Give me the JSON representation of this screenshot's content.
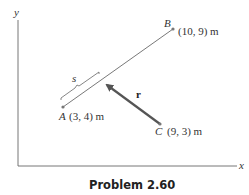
{
  "figure": {
    "caption": "Problem 2.60",
    "axes": {
      "x_label": "x",
      "y_label": "y"
    },
    "points": {
      "A": {
        "name": "A",
        "coords_label": "(3, 4) m",
        "x": 3,
        "y": 4
      },
      "B": {
        "name": "B",
        "coords_label": "(10, 9) m",
        "x": 10,
        "y": 9
      },
      "C": {
        "name": "C",
        "coords_label": "(9, 3) m",
        "x": 9,
        "y": 3
      }
    },
    "vector": {
      "label": "r",
      "from": "C",
      "to": "point on line AB"
    },
    "distance_label": "s",
    "colors": {
      "line": "#555555",
      "vector": "#555555",
      "axis": "#666666",
      "point": "#777777"
    }
  }
}
